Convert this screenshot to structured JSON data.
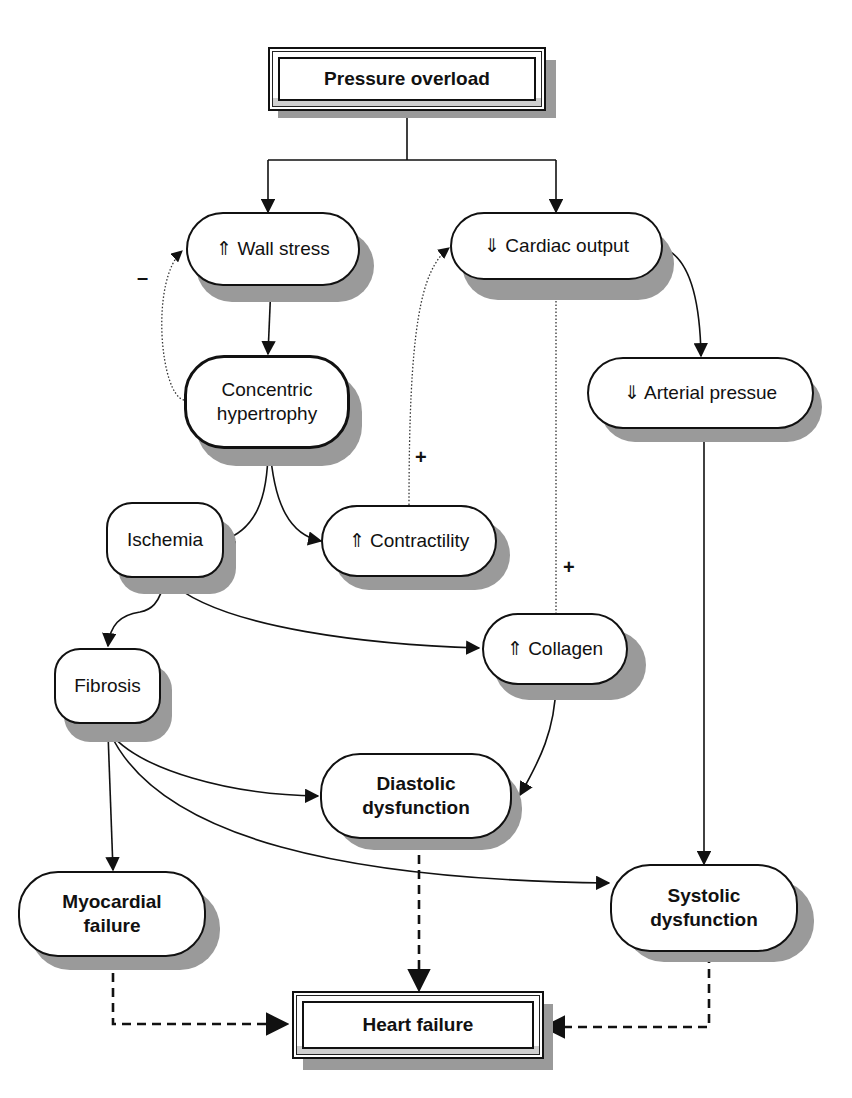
{
  "diagram": {
    "nodes": {
      "pressure_overload": "Pressure overload",
      "wall_stress": "⇑ Wall stress",
      "cardiac_output": "⇓ Cardiac output",
      "concentric_hypertrophy": "Concentric hypertrophy",
      "arterial_pressure": "⇓ Arterial pressue",
      "ischemia": "Ischemia",
      "contractility": "⇑ Contractility",
      "fibrosis": "Fibrosis",
      "collagen": "⇑ Collagen",
      "diastolic_dysfunction": "Diastolic dysfunction",
      "myocardial_failure": "Myocardial failure",
      "systolic_dysfunction": "Systolic dysfunction",
      "heart_failure": "Heart failure"
    },
    "signs": {
      "negative_feedback": "–",
      "contractility_positive": "+",
      "collagen_positive": "+"
    },
    "edges": [
      {
        "from": "Pressure overload",
        "to": "⇑ Wall stress",
        "style": "solid"
      },
      {
        "from": "Pressure overload",
        "to": "⇓ Cardiac output",
        "style": "solid"
      },
      {
        "from": "⇑ Wall stress",
        "to": "Concentric hypertrophy",
        "style": "solid"
      },
      {
        "from": "Concentric hypertrophy",
        "to": "⇑ Wall stress",
        "style": "dotted",
        "sign": "–"
      },
      {
        "from": "Concentric hypertrophy",
        "to": "Ischemia",
        "style": "solid"
      },
      {
        "from": "Concentric hypertrophy",
        "to": "⇑ Contractility",
        "style": "solid"
      },
      {
        "from": "⇑ Contractility",
        "to": "⇓ Cardiac output",
        "style": "dotted",
        "sign": "+"
      },
      {
        "from": "⇑ Collagen",
        "to": "⇓ Cardiac output",
        "style": "dotted",
        "sign": "+"
      },
      {
        "from": "⇓ Cardiac output",
        "to": "⇓ Arterial pressue",
        "style": "solid"
      },
      {
        "from": "⇓ Arterial pressue",
        "to": "Systolic dysfunction",
        "style": "solid"
      },
      {
        "from": "Ischemia",
        "to": "Fibrosis",
        "style": "solid"
      },
      {
        "from": "Ischemia",
        "to": "⇑ Collagen",
        "style": "solid"
      },
      {
        "from": "⇑ Collagen",
        "to": "Diastolic dysfunction",
        "style": "solid"
      },
      {
        "from": "Fibrosis",
        "to": "Diastolic dysfunction",
        "style": "solid"
      },
      {
        "from": "Fibrosis",
        "to": "Myocardial failure",
        "style": "solid"
      },
      {
        "from": "Fibrosis",
        "to": "Systolic dysfunction",
        "style": "solid"
      },
      {
        "from": "Myocardial failure",
        "to": "Heart failure",
        "style": "dashed"
      },
      {
        "from": "Diastolic dysfunction",
        "to": "Heart failure",
        "style": "dashed"
      },
      {
        "from": "Systolic dysfunction",
        "to": "Heart failure",
        "style": "dashed"
      }
    ]
  }
}
